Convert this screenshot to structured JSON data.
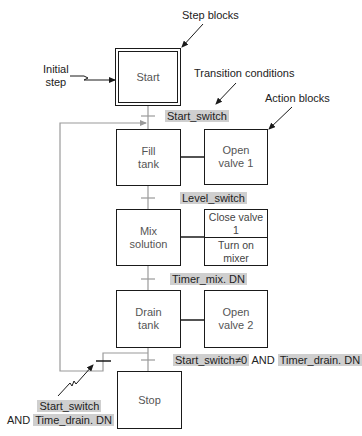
{
  "annotations": {
    "step_blocks": "Step blocks",
    "initial_step": "Initial\nstep",
    "transition_conditions": "Transition conditions",
    "action_blocks": "Action blocks"
  },
  "steps": [
    {
      "id": "start",
      "label": "Start",
      "initial": true
    },
    {
      "id": "fill",
      "label": "Fill\ntank"
    },
    {
      "id": "mix",
      "label": "Mix\nsolution"
    },
    {
      "id": "drain",
      "label": "Drain\ntank"
    },
    {
      "id": "stop",
      "label": "Stop"
    }
  ],
  "actions": {
    "fill": "Open\nvalve 1",
    "mix_top": "Close valve 1",
    "mix_bottom": "Turn on mixer",
    "drain": "Open\nvalve 2"
  },
  "transitions": {
    "t1": "Start_switch",
    "t2": "Level_switch",
    "t3": "Timer_mix. DN",
    "t4_part1": "Start_switch≠0",
    "t4_and": " AND ",
    "t4_part2": "Timer_drain. DN",
    "loop_part1": "Start_switch",
    "loop_and": "AND ",
    "loop_part2": "Time_drain. DN"
  },
  "colors": {
    "highlight": "#cfcfcf",
    "line": "#1a1a1a",
    "loop_line": "#9a9a9a"
  }
}
